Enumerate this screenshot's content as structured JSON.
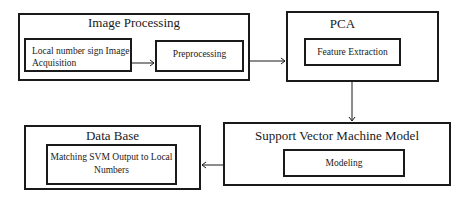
{
  "diagram": {
    "nodes": {
      "image_processing": {
        "title": "Image Processing",
        "children": {
          "acquisition": "Local number sign Image Acquisition",
          "acquisition_line1": "Local number sign Image",
          "acquisition_line2": "Acquisition",
          "preprocessing": "Preprocessing"
        }
      },
      "pca": {
        "title": "PCA",
        "children": {
          "feature_extraction": "Feature Extraction"
        }
      },
      "svm": {
        "title": "Support Vector Machine Model",
        "children": {
          "modeling": "Modeling"
        }
      },
      "database": {
        "title": "Data Base",
        "children": {
          "matching": "Matching SVM Output to Local Numbers",
          "matching_line1": "Matching SVM Output to Local",
          "matching_line2": "Numbers"
        }
      }
    },
    "edges": [
      {
        "from": "Local number sign Image Acquisition",
        "to": "Preprocessing"
      },
      {
        "from": "Image Processing",
        "to": "PCA"
      },
      {
        "from": "PCA",
        "to": "Support Vector Machine Model"
      },
      {
        "from": "Support Vector Machine Model",
        "to": "Data Base"
      }
    ],
    "colors": {
      "stroke": "#1a1a1a",
      "background": "#ffffff"
    }
  }
}
